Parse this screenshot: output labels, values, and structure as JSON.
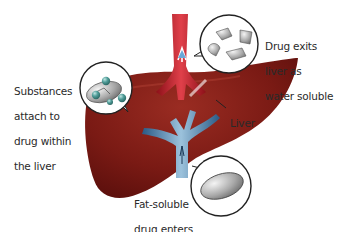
{
  "diagram": {
    "colors": {
      "liver": "#7a1a14",
      "liver_highlight": "#9a2c22",
      "artery": "#c0202a",
      "vein": "#3e6f9a",
      "callout_outline": "#222222",
      "molecule_gray": "#9a9a9a",
      "bead_teal": "#4f9c98"
    },
    "labels": {
      "substances": [
        "Substances",
        "attach to",
        "drug within",
        "the liver"
      ],
      "exits": [
        "Drug exits",
        "liver as",
        "water soluble"
      ],
      "liver": "Liver",
      "enters": [
        "Fat-soluble",
        "drug enters",
        "the liver"
      ]
    },
    "callouts": [
      {
        "name": "conjugation",
        "depicts": "gray drug molecule with attached teal beads"
      },
      {
        "name": "water-soluble-fragments",
        "depicts": "broken gray fragments"
      },
      {
        "name": "fat-soluble-drug",
        "depicts": "single smooth gray ellipse"
      }
    ]
  }
}
